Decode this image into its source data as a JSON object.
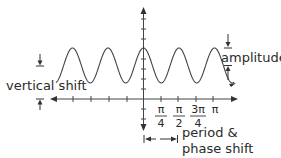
{
  "diagram": {
    "colors": {
      "stroke": "#444444",
      "text": "#2a2a2a",
      "background": "#ffffff"
    },
    "labels": {
      "amplitude": "amplitude",
      "vertical_shift": "vertical shift",
      "period_line1": "period &",
      "period_line2": "phase shift"
    },
    "x_ticks": [
      {
        "num": "π",
        "den": "4"
      },
      {
        "num": "π",
        "den": "2"
      },
      {
        "num": "3π",
        "den": "4"
      },
      {
        "num": "π",
        "den": ""
      }
    ]
  }
}
